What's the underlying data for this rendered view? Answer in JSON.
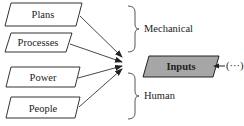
{
  "diagram": {
    "sources": [
      {
        "label": "Plans"
      },
      {
        "label": "Processes"
      },
      {
        "label": "Power"
      },
      {
        "label": "People"
      }
    ],
    "groups": [
      {
        "label": "Mechanical"
      },
      {
        "label": "Human"
      }
    ],
    "target": {
      "label": "Inputs",
      "fill": "#a6a6a6"
    },
    "continuation": {
      "label": "(···)"
    },
    "colors": {
      "stroke": "#333333",
      "box_fill": "#ffffff",
      "target_fill": "#a6a6a6"
    }
  }
}
